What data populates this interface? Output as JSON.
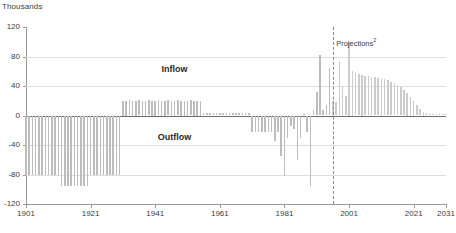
{
  "chart_data": {
    "type": "bar",
    "title": "",
    "unit_label": "Thousands",
    "xlabel": "",
    "ylabel": "",
    "ylim": [
      -120,
      120
    ],
    "y_ticks": [
      120,
      80,
      40,
      0,
      -40,
      -80,
      -120
    ],
    "xlim": [
      1901,
      2031
    ],
    "x_ticks": [
      1901,
      1921,
      1941,
      1961,
      1981,
      2001,
      2021,
      2031
    ],
    "grid": true,
    "legend_position": "inline-annotations",
    "annotations": [
      {
        "text": "Inflow",
        "x": 1947,
        "y": 62
      },
      {
        "text": "Outflow",
        "x": 1947,
        "y": -30
      },
      {
        "text": "Projections",
        "superscript": "2",
        "x": 1997,
        "y": 98
      }
    ],
    "projection_start_year": 1996,
    "bar_color": "#bdbdbd",
    "projection_bar_color": "#cccccc",
    "series": [
      {
        "name": "Net migration",
        "x": [
          1901,
          1902,
          1903,
          1904,
          1905,
          1906,
          1907,
          1908,
          1909,
          1910,
          1911,
          1912,
          1913,
          1914,
          1915,
          1916,
          1917,
          1918,
          1919,
          1920,
          1921,
          1922,
          1923,
          1924,
          1925,
          1926,
          1927,
          1928,
          1929,
          1930,
          1931,
          1932,
          1933,
          1934,
          1935,
          1936,
          1937,
          1938,
          1939,
          1940,
          1941,
          1942,
          1943,
          1944,
          1945,
          1946,
          1947,
          1948,
          1949,
          1950,
          1951,
          1952,
          1953,
          1954,
          1955,
          1956,
          1957,
          1958,
          1959,
          1960,
          1961,
          1962,
          1963,
          1964,
          1965,
          1966,
          1967,
          1968,
          1969,
          1970,
          1971,
          1972,
          1973,
          1974,
          1975,
          1976,
          1977,
          1978,
          1979,
          1980,
          1981,
          1982,
          1983,
          1984,
          1985,
          1986,
          1987,
          1988,
          1989,
          1990,
          1991,
          1992,
          1993,
          1994,
          1995,
          1996,
          1997,
          1998,
          1999,
          2000,
          2001,
          2002,
          2003,
          2004,
          2005,
          2006,
          2007,
          2008,
          2009,
          2010,
          2011,
          2012,
          2013,
          2014,
          2015,
          2016,
          2017,
          2018,
          2019,
          2020,
          2021,
          2022,
          2023,
          2024,
          2025,
          2026,
          2027,
          2028,
          2029,
          2030,
          2031
        ],
        "values": [
          -80,
          -80,
          -80,
          -81,
          -81,
          -80,
          -80,
          -81,
          -80,
          -80,
          -80,
          -95,
          -95,
          -95,
          -96,
          -95,
          -95,
          -95,
          -95,
          -95,
          -80,
          -80,
          -80,
          -80,
          -80,
          -80,
          -80,
          -80,
          -80,
          -80,
          20,
          20,
          21,
          20,
          20,
          21,
          20,
          20,
          21,
          20,
          20,
          21,
          20,
          20,
          21,
          20,
          20,
          21,
          20,
          20,
          20,
          21,
          20,
          20,
          20,
          3,
          3,
          3,
          3,
          3,
          3,
          3,
          3,
          3,
          3,
          3,
          3,
          3,
          3,
          3,
          -22,
          -22,
          -22,
          -22,
          -22,
          -22,
          -22,
          -35,
          -22,
          -55,
          -82,
          -30,
          -14,
          -18,
          -60,
          -30,
          2,
          -22,
          -95,
          8,
          32,
          82,
          8,
          14,
          64,
          20,
          18,
          74,
          40,
          26,
          100,
          60,
          58,
          56,
          55,
          54,
          53,
          52,
          52,
          51,
          50,
          49,
          48,
          46,
          44,
          41,
          38,
          34,
          30,
          25,
          20,
          14,
          9,
          5,
          3,
          2,
          2,
          2,
          2,
          2,
          2
        ]
      }
    ]
  }
}
